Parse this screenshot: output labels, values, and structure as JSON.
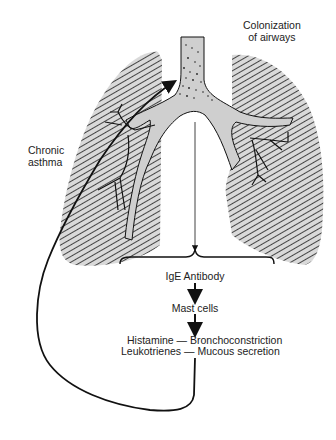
{
  "labels": {
    "colonization": [
      "Colonization",
      "of airways"
    ],
    "chronic_asthma": [
      "Chronic",
      "asthma"
    ],
    "cascade": {
      "ige": "IgE Antibody",
      "mast": "Mast cells",
      "histamine": "Histamine — Bronchoconstriction",
      "leukotrienes": "Leukotrienes — Mucous secretion"
    }
  },
  "colors": {
    "ink": "#111111",
    "lung_fill": "#d9d9d9",
    "airway_fill": "#cfcfcf",
    "background": "#ffffff"
  }
}
